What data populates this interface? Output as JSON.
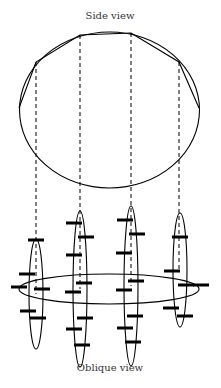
{
  "labels": {
    "side_view": "Side view",
    "oblique_view": "Oblique view"
  },
  "colors": {
    "stroke": "#000000",
    "text": "#333333",
    "background": "#ffffff"
  },
  "side_view": {
    "circle": {
      "cx": 109.5,
      "cy": 110,
      "rx": 90,
      "ry": 78
    },
    "polygon_vertices": [
      [
        19,
        108
      ],
      [
        36,
        62
      ],
      [
        80,
        35
      ],
      [
        131,
        33
      ],
      [
        179,
        62
      ],
      [
        199,
        108
      ]
    ],
    "dashed_lines_x": [
      36,
      80,
      131,
      179
    ]
  },
  "oblique_view": {
    "horizontal_ellipse": {
      "cx": 109,
      "cy": 289,
      "rx": 90,
      "ry": 15
    },
    "vertical_ellipses": [
      {
        "cx": 36,
        "cy": 294,
        "rx": 7,
        "ry": 55,
        "bars": [
          [
            36,
            240
          ],
          [
            27,
            274
          ],
          [
            19,
            287
          ],
          [
            42,
            289
          ],
          [
            28,
            311
          ],
          [
            38,
            318
          ]
        ]
      },
      {
        "cx": 80,
        "cy": 289,
        "rx": 7,
        "ry": 78,
        "bars": [
          [
            74,
            223
          ],
          [
            86,
            237
          ],
          [
            74,
            255
          ],
          [
            84,
            283
          ],
          [
            73,
            292
          ],
          [
            85,
            318
          ],
          [
            74,
            329
          ],
          [
            82,
            345
          ]
        ]
      },
      {
        "cx": 131,
        "cy": 286,
        "rx": 7,
        "ry": 80,
        "bars": [
          [
            125,
            220
          ],
          [
            137,
            234
          ],
          [
            124,
            253
          ],
          [
            136,
            281
          ],
          [
            124,
            290
          ],
          [
            135,
            316
          ],
          [
            125,
            328
          ],
          [
            133,
            342
          ]
        ]
      },
      {
        "cx": 180,
        "cy": 270,
        "rx": 7,
        "ry": 57,
        "bars": [
          [
            180,
            237
          ],
          [
            172,
            271
          ],
          [
            186,
            285
          ],
          [
            201,
            285
          ],
          [
            171,
            308
          ],
          [
            185,
            316
          ]
        ]
      }
    ]
  }
}
